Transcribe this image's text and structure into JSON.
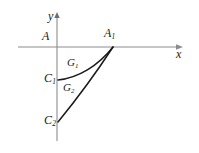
{
  "figure": {
    "kind": "coordinate-geometry-diagram",
    "background_color": "#ffffff",
    "axis_color": "#8c8c8c",
    "curve_color": "#1a1a1a",
    "label_color": "#1a1a1a",
    "axes": {
      "x_label": "x",
      "y_label": "y",
      "origin_px": [
        57,
        47
      ],
      "x_axis_span_px": [
        18,
        182
      ],
      "y_axis_span_px": [
        13,
        141
      ]
    },
    "points": [
      {
        "id": "A",
        "label": "A",
        "subscript": "",
        "px": [
          46,
          38
        ]
      },
      {
        "id": "A1",
        "label": "A",
        "subscript": "1",
        "px": [
          113,
          47
        ]
      },
      {
        "id": "C1",
        "label": "C",
        "subscript": "1",
        "px": [
          57,
          80
        ]
      },
      {
        "id": "C2",
        "label": "C",
        "subscript": "2",
        "px": [
          57,
          122
        ]
      }
    ],
    "curves": [
      {
        "id": "G1",
        "label": "G",
        "subscript": "1",
        "from": "C1",
        "to": "A1",
        "shape": "concave-arc",
        "path": "M 58 80 C 78 78 98 66 113 47"
      },
      {
        "id": "G2",
        "label": "G",
        "subscript": "2",
        "from": "C2",
        "to": "A1",
        "shape": "near-straight",
        "path": "M 58 122 C 76 100 98 70 113 47"
      }
    ]
  }
}
